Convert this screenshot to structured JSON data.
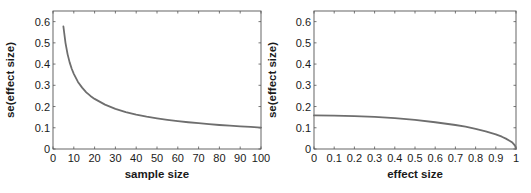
{
  "chart_data": [
    {
      "type": "line",
      "title": "",
      "xlabel": "sample size",
      "ylabel": "se(effect size)",
      "xlim": [
        0,
        100
      ],
      "ylim": [
        0,
        0.65
      ],
      "xticks": [
        0,
        10,
        20,
        30,
        40,
        50,
        60,
        70,
        80,
        90,
        100
      ],
      "yticks": [
        0,
        0.1,
        0.2,
        0.3,
        0.4,
        0.5,
        0.6
      ],
      "xtick_labels": [
        "0",
        "10",
        "20",
        "30",
        "40",
        "50",
        "60",
        "70",
        "80",
        "90",
        "100"
      ],
      "ytick_labels": [
        "0",
        "0.1",
        "0.2",
        "0.3",
        "0.4",
        "0.5",
        "0.6"
      ],
      "grid": false,
      "series": [
        {
          "name": "se vs sample size",
          "color": "#6e6e6e",
          "x": [
            5,
            6,
            7,
            8,
            9,
            10,
            12,
            14,
            16,
            18,
            20,
            25,
            30,
            35,
            40,
            45,
            50,
            55,
            60,
            65,
            70,
            75,
            80,
            85,
            90,
            95,
            100
          ],
          "y": [
            0.577,
            0.5,
            0.447,
            0.408,
            0.378,
            0.354,
            0.316,
            0.289,
            0.267,
            0.25,
            0.236,
            0.209,
            0.189,
            0.174,
            0.162,
            0.152,
            0.144,
            0.137,
            0.131,
            0.126,
            0.122,
            0.117,
            0.113,
            0.11,
            0.107,
            0.104,
            0.101
          ]
        }
      ]
    },
    {
      "type": "line",
      "title": "",
      "xlabel": "effect size",
      "ylabel": "se(effect size)",
      "xlim": [
        0,
        1
      ],
      "ylim": [
        0,
        0.65
      ],
      "xticks": [
        0,
        0.1,
        0.2,
        0.3,
        0.4,
        0.5,
        0.6,
        0.7,
        0.8,
        0.9,
        1
      ],
      "yticks": [
        0,
        0.1,
        0.2,
        0.3,
        0.4,
        0.5,
        0.6
      ],
      "xtick_labels": [
        "0",
        "0.1",
        "0.2",
        "0.3",
        "0.4",
        "0.5",
        "0.6",
        "0.7",
        "0.8",
        "0.9",
        "1"
      ],
      "ytick_labels": [
        "0",
        "0.1",
        "0.2",
        "0.3",
        "0.4",
        "0.5",
        "0.6"
      ],
      "grid": false,
      "series": [
        {
          "name": "se vs effect size",
          "color": "#6e6e6e",
          "x": [
            0,
            0.1,
            0.2,
            0.3,
            0.4,
            0.5,
            0.6,
            0.7,
            0.75,
            0.8,
            0.85,
            0.9,
            0.93,
            0.95,
            0.97,
            0.98,
            0.99,
            0.995,
            1
          ],
          "y": [
            0.158,
            0.157,
            0.155,
            0.151,
            0.145,
            0.137,
            0.126,
            0.113,
            0.105,
            0.095,
            0.083,
            0.069,
            0.058,
            0.049,
            0.038,
            0.032,
            0.022,
            0.016,
            0
          ]
        }
      ]
    }
  ]
}
